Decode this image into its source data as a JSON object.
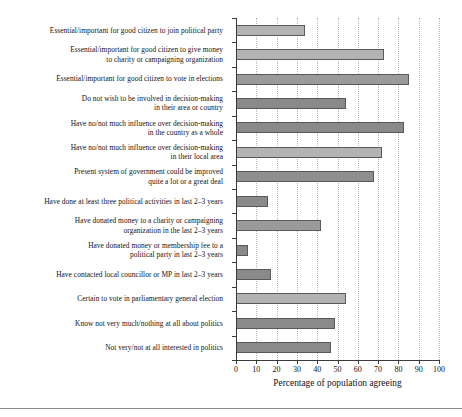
{
  "chart_data": {
    "type": "bar",
    "orientation": "horizontal",
    "title": "",
    "xlabel": "Percentage of population agreeing",
    "ylabel": "",
    "xlim": [
      0,
      100
    ],
    "xticks": [
      0,
      10,
      20,
      30,
      40,
      50,
      60,
      70,
      80,
      90,
      100
    ],
    "grid": "vertical-dotted",
    "legend": "none",
    "categories": [
      "Essential/important for good citizen to join political party",
      "Essential/important for good citizen to give money\nto charity or campaigning organization",
      "Essential/important for good citizen to vote in elections",
      "Do not wish to be involved in decision-making\nin their area or country",
      "Have no/not much influence over decision-making\nin the country as a whole",
      "Have no/not much influence over decision-making\nin their local area",
      "Present system of government could be improved\nquite a lot or a great deal",
      "Have done at least three political activities in last 2–3 years",
      "Have donated money to a charity or campaigning\norganization in the last 2–3 years",
      "Have donated money or membership fee to a\npolitical party in last 2–3 years",
      "Have contacted local councillor or MP in last 2–3 years",
      "Certain to vote in parliamentary general election",
      "Know not very much/nothing at all about politics",
      "Not very/not at all interested in politics"
    ],
    "values": [
      34,
      73,
      85,
      54,
      83,
      72,
      68,
      16,
      42,
      6,
      17,
      54,
      49,
      47
    ],
    "bar_colors": [
      "#b3b3b3",
      "#b3b3b3",
      "#9a9a9a",
      "#8a8a8a",
      "#8a8a8a",
      "#b3b3b3",
      "#8f8f8f",
      "#8a8a8a",
      "#9a9a9a",
      "#8a8a8a",
      "#8a8a8a",
      "#b3b3b3",
      "#8a8a8a",
      "#8a8a8a"
    ]
  },
  "colors": {
    "axis": "#3a3a3a",
    "grid": "#b9b9b9",
    "text": "#141414",
    "rule": "#8c8c8c",
    "background": "#ffffff"
  }
}
